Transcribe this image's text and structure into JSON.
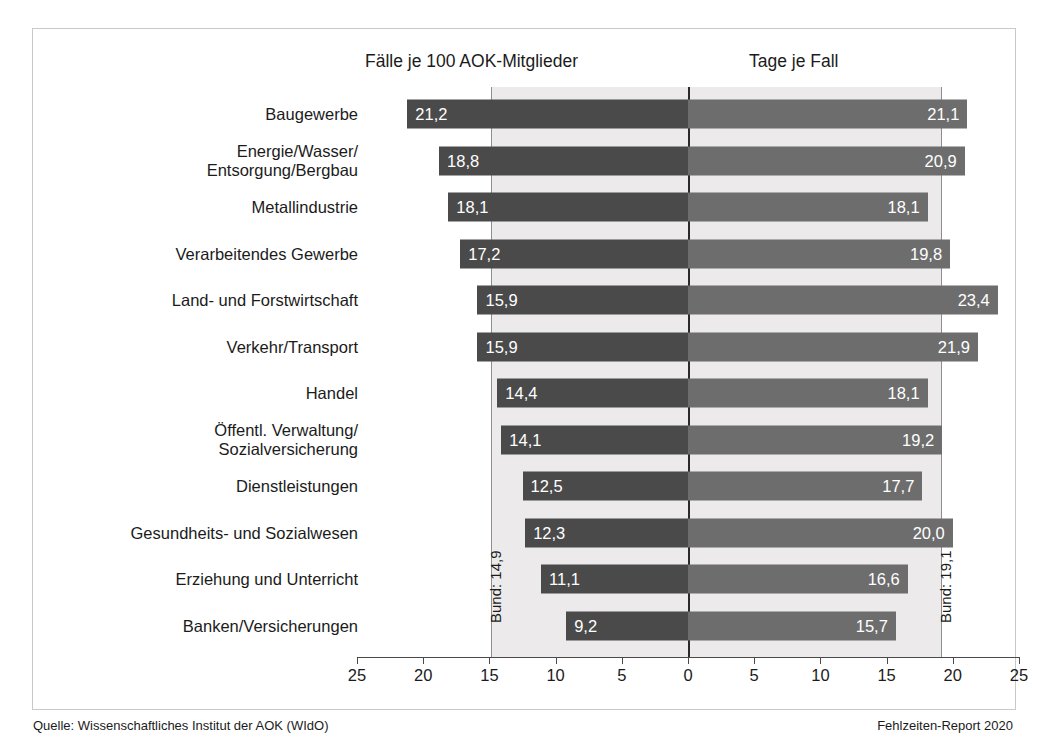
{
  "headings": {
    "left": "Fälle je 100 AOK-Mitglieder",
    "right": "Tage je Fall"
  },
  "reference": {
    "left_label": "Bund: 14,9",
    "right_label": "Bund: 19,1",
    "left_value": 14.9,
    "right_value": 19.1
  },
  "footer": {
    "source": "Quelle: Wissenschaftliches Institut der AOK (WIdO)",
    "report": "Fehlzeiten-Report 2020"
  },
  "colors": {
    "bar_left": "#4a4a4a",
    "bar_right": "#6d6d6d",
    "band": "#eceaea",
    "axis": "#4a4a4a",
    "reference_line": "#8e8e8e",
    "zero_line": "#2b2b2b",
    "value_text": "#ffffff",
    "frame": "#c9c9c9"
  },
  "chart_data": {
    "type": "bar",
    "title": "",
    "subtitle": "",
    "orientation": "horizontal-diverging",
    "categories": [
      "Baugewerbe",
      "Energie/Wasser/\nEntsorgung/Bergbau",
      "Metallindustrie",
      "Verarbeitendes Gewerbe",
      "Land- und Forstwirtschaft",
      "Verkehr/Transport",
      "Handel",
      "Öffentl. Verwaltung/\nSozialversicherung",
      "Dienstleistungen",
      "Gesundheits- und Sozialwesen",
      "Erziehung und Unterricht",
      "Banken/Versicherungen"
    ],
    "series": [
      {
        "name": "Fälle je 100 AOK-Mitglieder",
        "side": "left",
        "color": "#4a4a4a",
        "values": [
          21.2,
          18.8,
          18.1,
          17.2,
          15.9,
          15.9,
          14.4,
          14.1,
          12.5,
          12.3,
          11.1,
          9.2
        ],
        "labels": [
          "21,2",
          "18,8",
          "18,1",
          "17,2",
          "15,9",
          "15,9",
          "14,4",
          "14,1",
          "12,5",
          "12,3",
          "11,1",
          "9,2"
        ]
      },
      {
        "name": "Tage je Fall",
        "side": "right",
        "color": "#6d6d6d",
        "values": [
          21.1,
          20.9,
          18.1,
          19.8,
          23.4,
          21.9,
          18.1,
          19.2,
          17.7,
          20.0,
          16.6,
          15.7
        ],
        "labels": [
          "21,1",
          "20,9",
          "18,1",
          "19,8",
          "23,4",
          "21,9",
          "18,1",
          "19,2",
          "17,7",
          "20,0",
          "16,6",
          "15,7"
        ]
      }
    ],
    "xticks_left": [
      25,
      20,
      15,
      10,
      5,
      0
    ],
    "xticks_right": [
      5,
      10,
      15,
      20,
      25
    ],
    "xtick_labels": [
      "25",
      "20",
      "15",
      "10",
      "5",
      "0",
      "5",
      "10",
      "15",
      "20",
      "25"
    ],
    "xlim": [
      25,
      25
    ],
    "xlabel": "",
    "ylabel": "",
    "grid": false,
    "legend": "none",
    "annotations": [
      "Bund: 14,9",
      "Bund: 19,1"
    ]
  }
}
